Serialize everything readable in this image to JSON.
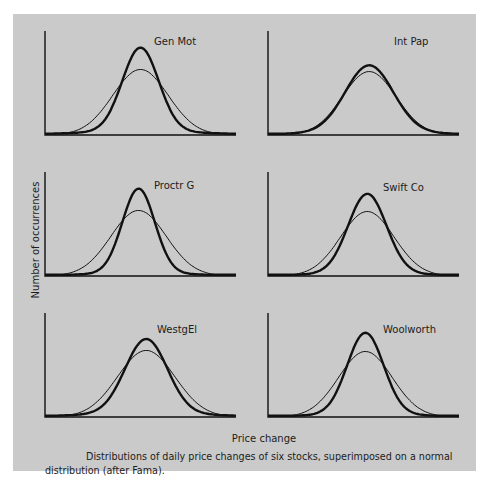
{
  "chart_data": {
    "type": "line",
    "layout": "3x2 small multiples",
    "xlabel": "Price change",
    "ylabel": "Number of occurrences",
    "caption": "Distributions of daily price changes of six stocks, superimposed on a normal distribution (after Fama).",
    "grid": false,
    "legend": "none (panel labels only)",
    "series_styles": {
      "empirical": {
        "description": "thick line - actual daily price change distribution",
        "stroke_width": 2.4,
        "color": "#111111"
      },
      "normal": {
        "description": "thin line - fitted normal distribution",
        "stroke_width": 1.0,
        "color": "#333333"
      }
    },
    "panels": [
      {
        "name": "Gen Mot",
        "row": 0,
        "col": 0,
        "empirical_peak": 0.84,
        "normal_peak": 0.63,
        "center": 0.5,
        "empirical_sigma": 0.095,
        "normal_sigma": 0.145,
        "tail": 0.06
      },
      {
        "name": "Int Pap",
        "row": 0,
        "col": 1,
        "empirical_peak": 0.67,
        "normal_peak": 0.61,
        "center": 0.53,
        "empirical_sigma": 0.125,
        "normal_sigma": 0.14,
        "tail": 0.05
      },
      {
        "name": "Proctr G",
        "row": 1,
        "col": 0,
        "empirical_peak": 0.84,
        "normal_peak": 0.63,
        "center": 0.49,
        "empirical_sigma": 0.085,
        "normal_sigma": 0.145,
        "tail": 0.04
      },
      {
        "name": "Swift Co",
        "row": 1,
        "col": 1,
        "empirical_peak": 0.79,
        "normal_peak": 0.62,
        "center": 0.52,
        "empirical_sigma": 0.1,
        "normal_sigma": 0.14,
        "tail": 0.04
      },
      {
        "name": "WestgEl",
        "row": 2,
        "col": 0,
        "empirical_peak": 0.75,
        "normal_peak": 0.64,
        "center": 0.53,
        "empirical_sigma": 0.11,
        "normal_sigma": 0.15,
        "tail": 0.06
      },
      {
        "name": "Woolworth",
        "row": 2,
        "col": 1,
        "empirical_peak": 0.81,
        "normal_peak": 0.63,
        "center": 0.51,
        "empirical_sigma": 0.095,
        "normal_sigma": 0.14,
        "tail": 0.04
      }
    ],
    "axis_range": {
      "x": [
        0,
        1
      ],
      "y": [
        0,
        1
      ]
    }
  },
  "figure": {
    "background": "#cacaca",
    "ink": "#111111",
    "x_axis_label": "Price change",
    "y_axis_label": "Number of occurrences",
    "caption_line1": "Distributions of daily price changes of six stocks, superimposed on a normal",
    "caption_line2": "distribution (after Fama)."
  }
}
